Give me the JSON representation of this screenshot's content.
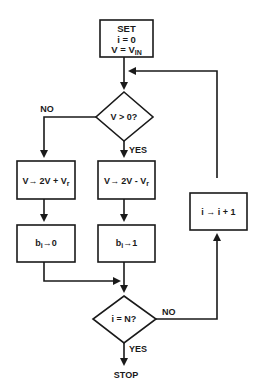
{
  "diagram": {
    "type": "flowchart",
    "colors": {
      "stroke": "#1a1a1a",
      "background": "#ffffff"
    },
    "start_box": {
      "line1": "SET",
      "line2": "i = 0",
      "line3_main": "V = V",
      "line3_sub": "IN"
    },
    "decision_v": {
      "label": "V > 0?",
      "no_label": "NO",
      "yes_label": "YES"
    },
    "box_add": {
      "main": "V",
      "arrow": "→",
      "expr": "2V + V",
      "sub": "r"
    },
    "box_sub": {
      "main": "V",
      "arrow": "→",
      "expr": "2V - V",
      "sub": "r"
    },
    "box_b0": {
      "main": "b",
      "sub": "i",
      "arrow": "→",
      "value": "0"
    },
    "box_b1": {
      "main": "b",
      "sub": "i",
      "arrow": "→",
      "value": "1"
    },
    "box_inc": {
      "text": "i → i + 1"
    },
    "decision_n": {
      "label": "i = N?",
      "no_label": "NO",
      "yes_label": "YES"
    },
    "stop_label": "STOP"
  }
}
